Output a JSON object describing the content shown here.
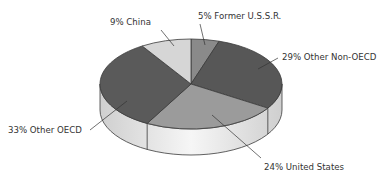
{
  "chart_data": {
    "type": "pie",
    "style": "3d",
    "title": "",
    "start_angle": "12 o'clock",
    "direction": "clockwise",
    "slices": [
      {
        "label": "Former U.S.S.R.",
        "value": 5,
        "display": "5% Former U.S.S.R.",
        "color": "#8a8a8a"
      },
      {
        "label": "Other Non-OECD",
        "value": 29,
        "display": "29% Other Non-OECD",
        "color": "#575757"
      },
      {
        "label": "United States",
        "value": 24,
        "display": "24% United States",
        "color": "#9b9b9b"
      },
      {
        "label": "Other OECD",
        "value": 33,
        "display": "33% Other OECD",
        "color": "#5a5a5a"
      },
      {
        "label": "China",
        "value": 9,
        "display": "9% China",
        "color": "#d6d6d6"
      }
    ],
    "side_color": "#e4e4e4",
    "edge_color": "#3a3a3a"
  }
}
